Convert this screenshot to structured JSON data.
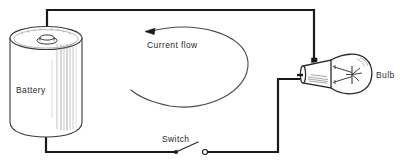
{
  "figure": {
    "name": "simple-electric-circuit-diagram",
    "width": 400,
    "height": 165,
    "background_color": "#ffffff"
  },
  "colors": {
    "wire": "#1a1a1a",
    "outline": "#3a3a3a",
    "shading": "#8a8a8a",
    "text": "#2b2b2b",
    "fill": "#ffffff"
  },
  "labels": {
    "battery": "Battery",
    "bulb": "Bulb",
    "switch": "Switch",
    "current_flow": "Current flow"
  },
  "components": {
    "battery": {
      "label": "Battery",
      "shape": "cylinder",
      "terminal": "top-post",
      "position": {
        "x": 8,
        "y": 27,
        "width": 75,
        "height": 110
      }
    },
    "bulb": {
      "label": "Bulb",
      "shape": "incandescent-lamp",
      "position": {
        "x": 300,
        "y": 50,
        "width": 70,
        "height": 45
      }
    },
    "switch": {
      "label": "Switch",
      "state": "open",
      "position": {
        "x": 165,
        "y": 150,
        "width": 45,
        "height": 10
      }
    },
    "current_flow": {
      "label": "Current flow",
      "direction": "counterclockwise",
      "arrow_head": "top-left"
    }
  },
  "wires": [
    {
      "name": "battery-top-to-bulb-top",
      "path": "up-right-down"
    },
    {
      "name": "battery-bottom-to-switch",
      "path": "down-right"
    },
    {
      "name": "switch-to-bulb-base",
      "path": "right-up-right"
    }
  ]
}
